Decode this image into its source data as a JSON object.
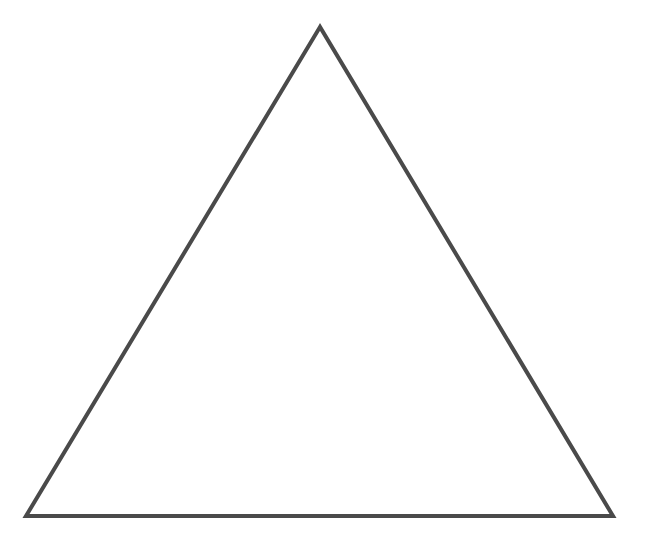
{
  "diagram": {
    "shape": "triangle",
    "kind": "equilateral-outline",
    "vertices": [
      [
        320,
        27
      ],
      [
        26,
        516
      ],
      [
        613,
        516
      ]
    ],
    "stroke_color": "#4a4a4a",
    "stroke_width": 4,
    "fill_color": "none",
    "background_color": "#ffffff"
  }
}
